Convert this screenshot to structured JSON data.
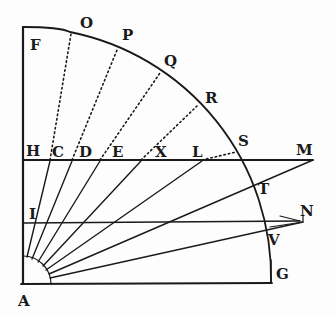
{
  "diagram": {
    "type": "geometric-woodcut",
    "colors": {
      "ink": "#1a1a1a",
      "paper": "#fdfdfd"
    },
    "points": {
      "A": {
        "label": "A",
        "x": 23,
        "y": 283,
        "lx": 18,
        "ly": 306
      },
      "F": {
        "label": "F",
        "x": 23,
        "y": 27,
        "lx": 30,
        "ly": 50
      },
      "O": {
        "label": "O",
        "x": 70,
        "y": 32,
        "lx": 80,
        "ly": 28
      },
      "P": {
        "label": "P",
        "x": 117,
        "y": 48,
        "lx": 122,
        "ly": 40
      },
      "Q": {
        "label": "Q",
        "x": 160,
        "y": 72,
        "lx": 164,
        "ly": 66
      },
      "R": {
        "label": "R",
        "x": 197,
        "y": 105,
        "lx": 205,
        "ly": 103
      },
      "S": {
        "label": "S",
        "x": 236,
        "y": 152,
        "lx": 238,
        "ly": 146
      },
      "T": {
        "label": "T",
        "x": 251,
        "y": 187,
        "lx": 258,
        "ly": 194
      },
      "V": {
        "label": "V",
        "x": 266,
        "y": 232,
        "lx": 268,
        "ly": 245
      },
      "G": {
        "label": "G",
        "x": 271,
        "y": 283,
        "lx": 276,
        "ly": 279
      },
      "H": {
        "label": "H",
        "x": 23,
        "y": 160,
        "lx": 26,
        "ly": 156
      },
      "C": {
        "label": "C",
        "x": 50,
        "y": 160,
        "lx": 52,
        "ly": 157
      },
      "D": {
        "label": "D",
        "x": 72,
        "y": 160,
        "lx": 79,
        "ly": 157
      },
      "E": {
        "label": "E",
        "x": 100,
        "y": 160,
        "lx": 112,
        "ly": 157
      },
      "X": {
        "label": "X",
        "x": 141,
        "y": 160,
        "lx": 155,
        "ly": 157
      },
      "L": {
        "label": "L",
        "x": 202,
        "y": 160,
        "lx": 192,
        "ly": 157
      },
      "M": {
        "label": "M",
        "x": 313,
        "y": 160,
        "lx": 296,
        "ly": 155
      },
      "I": {
        "label": "I",
        "x": 23,
        "y": 223,
        "lx": 29,
        "ly": 219
      },
      "N": {
        "label": "N",
        "x": 303,
        "y": 222,
        "lx": 300,
        "ly": 216
      }
    },
    "labels": [
      "F",
      "O",
      "P",
      "Q",
      "R",
      "S",
      "T",
      "V",
      "G",
      "H",
      "C",
      "D",
      "E",
      "X",
      "L",
      "M",
      "I",
      "N",
      "A"
    ]
  }
}
